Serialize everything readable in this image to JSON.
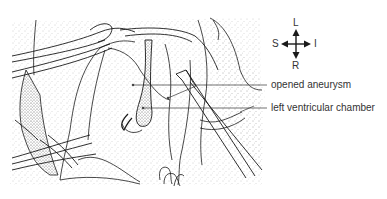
{
  "figure": {
    "type": "surgical line illustration"
  },
  "compass": {
    "top": "L",
    "left": "S",
    "right": "I",
    "bottom": "R"
  },
  "labels": [
    {
      "id": "opened-aneurysm",
      "text": "opened aneurysm"
    },
    {
      "id": "left-ventricular-chamber",
      "text": "left ventricular chamber"
    }
  ],
  "colors": {
    "line": "#1a1a1a",
    "stipple": "#9a9a9a",
    "text": "#333333",
    "background": "#ffffff"
  }
}
